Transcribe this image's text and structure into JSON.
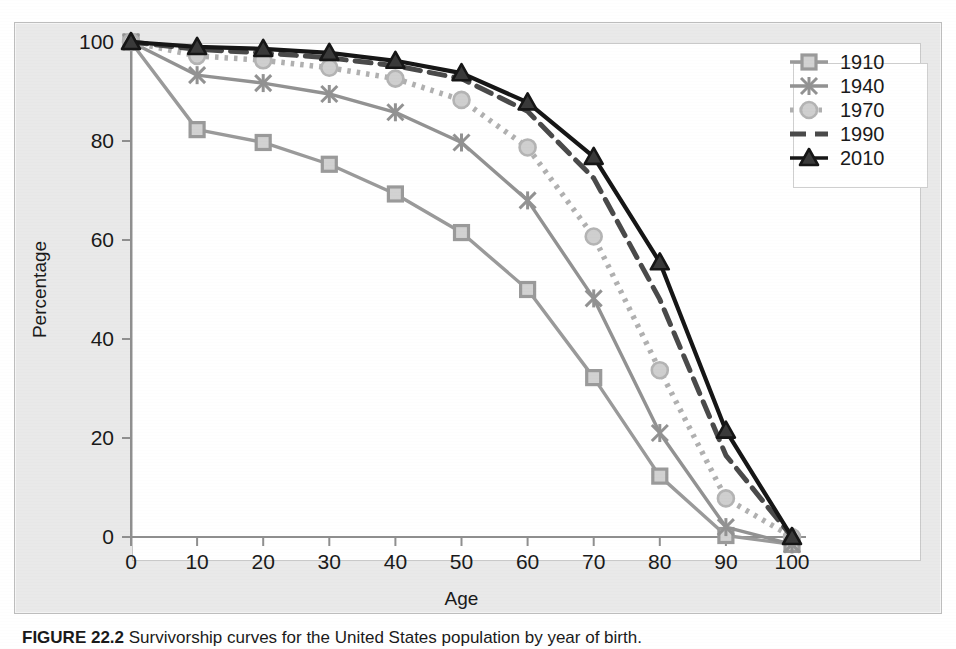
{
  "figure": {
    "caption_label": "FIGURE 22.2",
    "caption_text": "Survivorship curves for the United States population by year of birth."
  },
  "chart_data": {
    "type": "line",
    "title": "",
    "xlabel": "Age",
    "ylabel": "Percentage",
    "x": [
      0,
      10,
      20,
      30,
      40,
      50,
      60,
      70,
      80,
      90,
      100
    ],
    "xlim": [
      0,
      100
    ],
    "ylim": [
      0,
      100
    ],
    "xticks": [
      "0",
      "10",
      "20",
      "30",
      "40",
      "50",
      "60",
      "70",
      "80",
      "90",
      "100"
    ],
    "yticks": [
      "0",
      "20",
      "40",
      "60",
      "80",
      "100"
    ],
    "grid": false,
    "legend_position": "top-right",
    "series": [
      {
        "name": "1910",
        "color": "#9a9a9a",
        "marker": "square",
        "dash": "solid",
        "values": [
          100,
          82.3,
          79.7,
          75.3,
          69.3,
          61.5,
          50.0,
          32.2,
          12.3,
          0.3,
          -1.5
        ]
      },
      {
        "name": "1940",
        "color": "#929292",
        "marker": "star",
        "dash": "solid",
        "values": [
          100,
          93.3,
          91.7,
          89.5,
          85.8,
          79.7,
          68.0,
          48.2,
          21.0,
          2.0,
          -1.5
        ]
      },
      {
        "name": "1970",
        "color": "#b0b0b0",
        "marker": "circle",
        "dash": "dotted",
        "values": [
          100,
          97.2,
          96.3,
          94.8,
          92.6,
          88.3,
          78.7,
          60.7,
          33.7,
          7.8,
          0
        ]
      },
      {
        "name": "1990",
        "color": "#4a4a4a",
        "marker": "none",
        "dash": "dashed",
        "values": [
          100,
          98.5,
          97.8,
          96.8,
          95.2,
          92.6,
          86.0,
          72.5,
          48.0,
          16.5,
          0
        ]
      },
      {
        "name": "2010",
        "color": "#161616",
        "marker": "triangle",
        "dash": "solid",
        "values": [
          100,
          99.0,
          98.6,
          97.8,
          96.2,
          93.7,
          87.8,
          76.8,
          55.5,
          21.5,
          0
        ]
      }
    ]
  },
  "legend": {
    "entries": [
      {
        "label": "1910"
      },
      {
        "label": "1940"
      },
      {
        "label": "1970"
      },
      {
        "label": "1990"
      },
      {
        "label": "2010"
      }
    ]
  }
}
